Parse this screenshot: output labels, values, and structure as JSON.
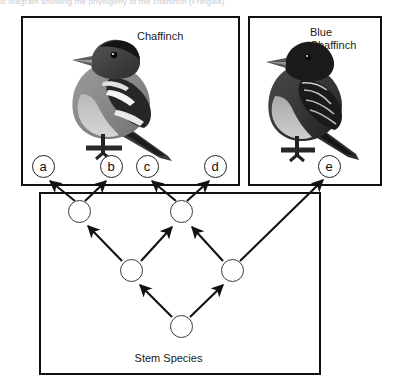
{
  "figure": {
    "top_caption_fragment": "ic diagram showing the phylogeny of the chaffinch (Fringilla)",
    "width": 401,
    "height": 388,
    "background_color": "#ffffff",
    "line_color": "#111111"
  },
  "panels": [
    {
      "id": "panel-chaffinch",
      "name": "chaffinch-panel",
      "label": "Chaffinch",
      "bird": "chaffinch-illustration",
      "x": 21,
      "y": 16,
      "width": 219,
      "height": 170
    },
    {
      "id": "panel-blue",
      "name": "blue-chaffinch-panel",
      "label": "Blue\nChaffinch",
      "bird": "blue-chaffinch-illustration",
      "x": 248,
      "y": 16,
      "width": 134,
      "height": 170
    },
    {
      "id": "panel-tree",
      "name": "stem-species-panel",
      "label": "Stem Species",
      "x": 39,
      "y": 192,
      "width": 282,
      "height": 183
    }
  ],
  "taxa": [
    {
      "id": "a",
      "label": "a",
      "cx": 43,
      "cy": 166,
      "panel": "panel-chaffinch"
    },
    {
      "id": "b",
      "label": "b",
      "cx": 111,
      "cy": 166,
      "panel": "panel-chaffinch"
    },
    {
      "id": "c",
      "label": "c",
      "cx": 147,
      "cy": 166,
      "panel": "panel-chaffinch"
    },
    {
      "id": "d",
      "label": "d",
      "cx": 215,
      "cy": 166,
      "panel": "panel-chaffinch"
    },
    {
      "id": "e",
      "label": "e",
      "cx": 329,
      "cy": 166,
      "panel": "panel-blue"
    }
  ],
  "tree_nodes": [
    {
      "id": "n1",
      "name": "node-upper-left",
      "cx": 79,
      "cy": 211
    },
    {
      "id": "n2",
      "name": "node-upper-middle",
      "cx": 181,
      "cy": 211
    },
    {
      "id": "n3",
      "name": "node-mid-left",
      "cx": 131,
      "cy": 270
    },
    {
      "id": "n4",
      "name": "node-mid-right",
      "cx": 232,
      "cy": 270
    },
    {
      "id": "n5",
      "name": "node-root",
      "cx": 181,
      "cy": 326
    }
  ],
  "arrows": [
    {
      "from": "n5",
      "to": "n3",
      "name": "arrow-root-to-mid-left"
    },
    {
      "from": "n5",
      "to": "n4",
      "name": "arrow-root-to-mid-right"
    },
    {
      "from": "n3",
      "to": "n1",
      "name": "arrow-mid-left-to-upper-left"
    },
    {
      "from": "n3",
      "to": "n2",
      "name": "arrow-mid-left-to-upper-middle"
    },
    {
      "from": "n4",
      "to": "n2",
      "name": "arrow-mid-right-to-upper-middle"
    },
    {
      "from": "n4",
      "to": "e",
      "name": "arrow-mid-right-to-taxon-e"
    },
    {
      "from": "n1",
      "to": "a",
      "name": "arrow-upper-left-to-taxon-a"
    },
    {
      "from": "n1",
      "to": "b",
      "name": "arrow-upper-left-to-taxon-b"
    },
    {
      "from": "n2",
      "to": "c",
      "name": "arrow-upper-middle-to-taxon-c"
    },
    {
      "from": "n2",
      "to": "d",
      "name": "arrow-upper-middle-to-taxon-d"
    }
  ]
}
